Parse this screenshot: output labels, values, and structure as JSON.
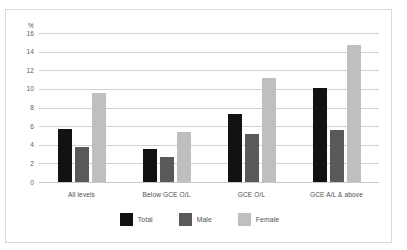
{
  "chart_data": {
    "type": "bar",
    "title": "",
    "xlabel": "",
    "ylabel": "%",
    "ylim": [
      0,
      16
    ],
    "ytick_step": 2,
    "yticks": [
      "16",
      "14",
      "12",
      "10",
      "8",
      "6",
      "4",
      "2",
      "0"
    ],
    "grid": true,
    "legend_position": "bottom",
    "categories": [
      "All levels",
      "Below GCE O/L",
      "GCE O/L",
      "GCE A/L & above"
    ],
    "series": [
      {
        "name": "Total",
        "color": "#121212",
        "values": [
          5.7,
          3.5,
          7.3,
          10.1
        ]
      },
      {
        "name": "Male",
        "color": "#595959",
        "values": [
          3.8,
          2.7,
          5.2,
          5.6
        ]
      },
      {
        "name": "Female",
        "color": "#bfbfbf",
        "values": [
          9.6,
          5.4,
          11.2,
          14.7
        ]
      }
    ]
  }
}
